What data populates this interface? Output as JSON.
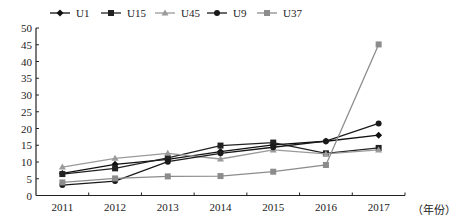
{
  "chart_data": {
    "type": "line",
    "title": "",
    "xlabel": "（年份）",
    "ylabel": "",
    "categories": [
      "2011",
      "2012",
      "2013",
      "2014",
      "2015",
      "2016",
      "2017"
    ],
    "ylim": [
      0,
      50
    ],
    "yticks": [
      0,
      5,
      10,
      15,
      20,
      25,
      30,
      35,
      40,
      45,
      50
    ],
    "grid": false,
    "legend_position": "top",
    "series": [
      {
        "name": "U1",
        "marker": "diamond",
        "color": "#111111",
        "values": [
          6.6,
          9.3,
          10.8,
          13.1,
          15.1,
          16.2,
          18.0
        ]
      },
      {
        "name": "U15",
        "marker": "square",
        "color": "#222222",
        "values": [
          6.4,
          8.1,
          11.2,
          14.9,
          15.8,
          12.6,
          14.2
        ]
      },
      {
        "name": "U45",
        "marker": "triangle",
        "color": "#9a9a9a",
        "values": [
          8.5,
          11.1,
          12.6,
          10.9,
          13.6,
          12.4,
          13.6
        ]
      },
      {
        "name": "U9",
        "marker": "circle",
        "color": "#1a1a1a",
        "values": [
          3.1,
          4.3,
          10.1,
          12.6,
          14.4,
          16.2,
          21.5
        ]
      },
      {
        "name": "U37",
        "marker": "square",
        "color": "#8c8c8c",
        "values": [
          3.9,
          5.1,
          5.7,
          5.8,
          7.1,
          9.1,
          45.1
        ]
      }
    ]
  }
}
